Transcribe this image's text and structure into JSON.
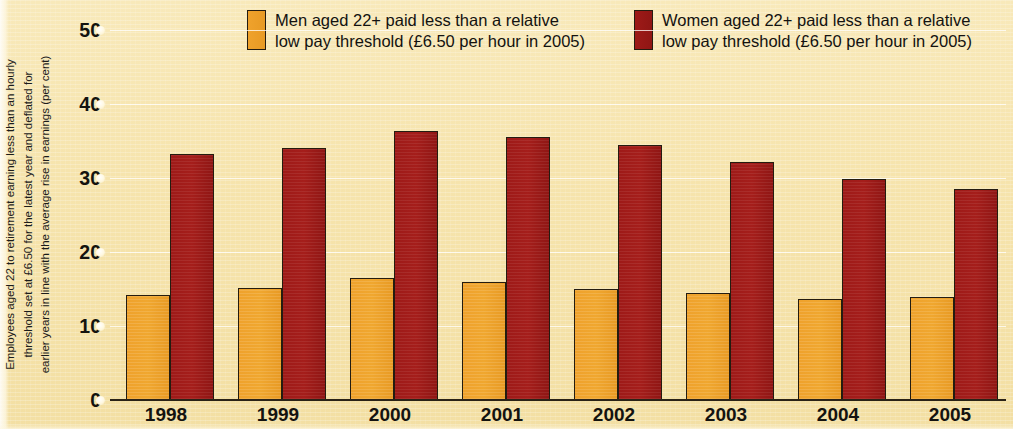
{
  "chart_data": {
    "type": "bar",
    "title": "",
    "subtitle": "",
    "xlabel": "",
    "ylabel": "Employees aged 22 to retirement earning less than an hourly\nthreshold set at £6.50 for the latest year and deflated for\nearlier years in line with the average rise in earnings (per cent)",
    "categories": [
      "1998",
      "1999",
      "2000",
      "2001",
      "2002",
      "2003",
      "2004",
      "2005"
    ],
    "series": [
      {
        "name": "Men aged 22+ paid less than a relative low pay threshold (£6.50 per hour in 2005)",
        "short_name": "Men aged 22+",
        "color": "#efa22c",
        "values": [
          14.2,
          15.2,
          16.5,
          16.0,
          15.0,
          14.4,
          13.7,
          13.9
        ]
      },
      {
        "name": "Women aged 22+ paid less than a relative low pay threshold (£6.50 per hour in 2005)",
        "short_name": "Women aged 22+",
        "color": "#9e1a18",
        "values": [
          33.3,
          34.1,
          36.3,
          35.5,
          34.5,
          32.1,
          29.8,
          28.5
        ]
      }
    ],
    "ylim": [
      0,
      50
    ],
    "yticks": [
      0,
      10,
      20,
      30,
      40,
      50
    ],
    "ytick_labels": [
      "0",
      "10",
      "20",
      "30",
      "40",
      "50"
    ],
    "grid": true,
    "grid_axis": "y",
    "legend_position": "top",
    "background_color": "#f6e4ad",
    "axis_color": "#241c10"
  },
  "legend": {
    "items": [
      {
        "label": "Men aged 22+ paid less than a relative\nlow pay threshold (£6.50 per hour in 2005)",
        "color": "#efa22c"
      },
      {
        "label": "Women aged 22+ paid less than a relative\nlow pay threshold (£6.50 per hour in 2005)",
        "color": "#9e1a18"
      }
    ]
  },
  "axes": {
    "y_caption": "Employees aged 22 to retirement earning less than an hourly\nthreshold set at £6.50 for the latest year and deflated for\nearlier years in line with the average rise in earnings (per cent)"
  }
}
